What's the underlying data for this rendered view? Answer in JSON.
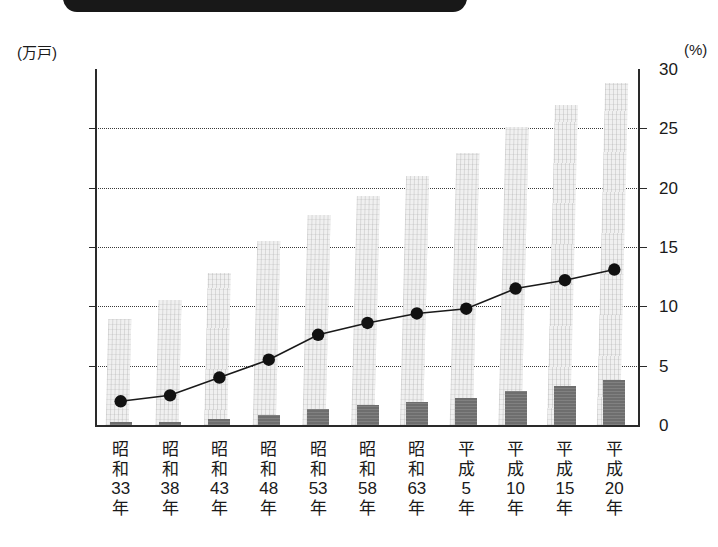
{
  "banner": {
    "name": "title-banner-black-bar"
  },
  "axes": {
    "left_unit": "(万戸)",
    "right_unit": "(%)",
    "left_ticks": [
      "6000",
      "5000",
      "4000",
      "3000",
      "2000",
      "1000",
      "0"
    ],
    "left_tick_values": [
      6000,
      5000,
      4000,
      3000,
      2000,
      1000,
      0
    ],
    "right_ticks": [
      "30",
      "25",
      "20",
      "15",
      "10",
      "5",
      "0"
    ],
    "right_tick_values": [
      30,
      25,
      20,
      15,
      10,
      5,
      0
    ],
    "left_min": 0,
    "left_max": 6000,
    "right_min": 0,
    "right_max": 30
  },
  "categories": [
    {
      "era": "昭和",
      "num": "33",
      "suffix": "年"
    },
    {
      "era": "昭和",
      "num": "38",
      "suffix": "年"
    },
    {
      "era": "昭和",
      "num": "43",
      "suffix": "年"
    },
    {
      "era": "昭和",
      "num": "48",
      "suffix": "年"
    },
    {
      "era": "昭和",
      "num": "53",
      "suffix": "年"
    },
    {
      "era": "昭和",
      "num": "58",
      "suffix": "年"
    },
    {
      "era": "昭和",
      "num": "63",
      "suffix": "年"
    },
    {
      "era": "平成",
      "num": "5",
      "suffix": "年"
    },
    {
      "era": "平成",
      "num": "10",
      "suffix": "年"
    },
    {
      "era": "平成",
      "num": "15",
      "suffix": "年"
    },
    {
      "era": "平成",
      "num": "20",
      "suffix": "年"
    }
  ],
  "colors": {
    "bar_light": "#f0f0f0",
    "bar_dark": "#6e6e6e",
    "line": "#1a1a1a",
    "marker": "#111111",
    "axis": "#2a2a2a",
    "grid": "#3a3a3a",
    "banner": "#181818"
  },
  "chart_data": {
    "type": "bar",
    "title": "",
    "xlabel": "",
    "ylabel": "(万戸)",
    "y2label": "(%)",
    "ylim": [
      0,
      6000
    ],
    "y2lim": [
      0,
      30
    ],
    "grid": true,
    "legend": "none",
    "categories": [
      "昭和33年",
      "昭和38年",
      "昭和43年",
      "昭和48年",
      "昭和53年",
      "昭和58年",
      "昭和63年",
      "平成5年",
      "平成10年",
      "平成15年",
      "平成20年"
    ],
    "series": [
      {
        "name": "総住宅数",
        "type": "bar",
        "axis": "left",
        "unit": "万戸",
        "color": "#f0f0f0",
        "values": [
          1793,
          2109,
          2559,
          3106,
          3545,
          3861,
          4201,
          4588,
          5025,
          5387,
          5759
        ]
      },
      {
        "name": "空き家数",
        "type": "bar",
        "axis": "left",
        "unit": "万戸",
        "color": "#6e6e6e",
        "values": [
          36,
          52,
          103,
          172,
          268,
          330,
          394,
          448,
          576,
          659,
          757
        ]
      },
      {
        "name": "空き家率",
        "type": "line",
        "axis": "right",
        "unit": "%",
        "color": "#1a1a1a",
        "values": [
          2.0,
          2.5,
          4.0,
          5.5,
          7.6,
          8.6,
          9.4,
          9.8,
          11.5,
          12.2,
          13.1
        ]
      }
    ]
  }
}
